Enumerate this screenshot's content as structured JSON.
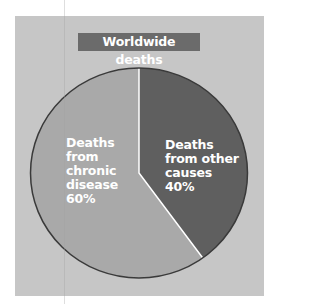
{
  "chart_data": {
    "type": "pie",
    "title": "Worldwide deaths",
    "categories": [
      "Deaths from other causes",
      "Deaths from chronic disease"
    ],
    "values": [
      40,
      60
    ],
    "unit": "%",
    "labels": [
      {
        "lines": [
          "Deaths",
          "from other",
          "causes",
          "40%"
        ],
        "value": 40
      },
      {
        "lines": [
          "Deaths",
          "from",
          "chronic",
          "disease",
          "60%"
        ],
        "value": 60
      }
    ],
    "start_angle": "12 o'clock, clockwise",
    "legend": "none (labels inside slices)"
  },
  "colors": {
    "panel_background": "#c6c6c6",
    "title_background": "#6b6b6b",
    "title_text": "#ffffff",
    "slice_other": "#5f5f5f",
    "slice_chronic": "#a9a9a9",
    "outline": "#3a3a3a",
    "divider": "#ffffff",
    "label_text": "#ffffff"
  }
}
